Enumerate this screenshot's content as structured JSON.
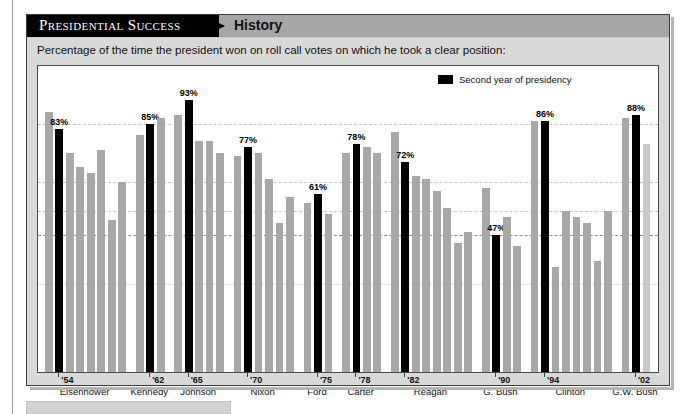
{
  "header": {
    "banner_title": "Presidential Success",
    "banner_sub": "History"
  },
  "subtitle": "Percentage of the time the president won on roll call votes on which he took a clear position:",
  "legend": {
    "swatch_color": "#000000",
    "label": "Second year of presidency"
  },
  "colors": {
    "bar_gray": "#a8a8a8",
    "bar_black": "#000000",
    "bar_light": "#c9c9c9",
    "card_bg": "#d9d9d9",
    "banner_bg": "#a6a6a6",
    "plot_bg": "#ffffff"
  },
  "chart_data": {
    "type": "bar",
    "title": "Presidential Success",
    "subtitle": "Percentage of the time the president won on roll call votes on which he took a clear position:",
    "xlabel": "",
    "ylabel": "",
    "ylim": [
      0,
      100
    ],
    "grid": true,
    "legend_position": "top-right",
    "legend": [
      "Second year of presidency"
    ],
    "highlight_label_suffix": "%",
    "series": [
      {
        "name": "Presidential success rate",
        "points": [
          {
            "president": "Eisenhower",
            "year": "'53",
            "value": 89,
            "second_year": false,
            "label": ""
          },
          {
            "president": "Eisenhower",
            "year": "'54",
            "value": 83,
            "second_year": true,
            "label": "83%"
          },
          {
            "president": "Eisenhower",
            "year": "'55",
            "value": 75,
            "second_year": false,
            "label": ""
          },
          {
            "president": "Eisenhower",
            "year": "'56",
            "value": 70,
            "second_year": false,
            "label": ""
          },
          {
            "president": "Eisenhower",
            "year": "'57",
            "value": 68,
            "second_year": false,
            "label": ""
          },
          {
            "president": "Eisenhower",
            "year": "'58",
            "value": 76,
            "second_year": false,
            "label": ""
          },
          {
            "president": "Eisenhower",
            "year": "'59",
            "value": 52,
            "second_year": false,
            "label": ""
          },
          {
            "president": "Eisenhower",
            "year": "'60",
            "value": 65,
            "second_year": false,
            "label": ""
          },
          {
            "president": "Kennedy",
            "year": "'61",
            "value": 81,
            "second_year": false,
            "label": ""
          },
          {
            "president": "Kennedy",
            "year": "'62",
            "value": 85,
            "second_year": true,
            "label": "85%"
          },
          {
            "president": "Kennedy",
            "year": "'63",
            "value": 87,
            "second_year": false,
            "label": ""
          },
          {
            "president": "Johnson",
            "year": "'64",
            "value": 88,
            "second_year": false,
            "label": ""
          },
          {
            "president": "Johnson",
            "year": "'65",
            "value": 93,
            "second_year": true,
            "label": "93%"
          },
          {
            "president": "Johnson",
            "year": "'66",
            "value": 79,
            "second_year": false,
            "label": ""
          },
          {
            "president": "Johnson",
            "year": "'67",
            "value": 79,
            "second_year": false,
            "label": ""
          },
          {
            "president": "Johnson",
            "year": "'68",
            "value": 75,
            "second_year": false,
            "label": ""
          },
          {
            "president": "Nixon",
            "year": "'69",
            "value": 74,
            "second_year": false,
            "label": ""
          },
          {
            "president": "Nixon",
            "year": "'70",
            "value": 77,
            "second_year": true,
            "label": "77%"
          },
          {
            "president": "Nixon",
            "year": "'71",
            "value": 75,
            "second_year": false,
            "label": ""
          },
          {
            "president": "Nixon",
            "year": "'72",
            "value": 66,
            "second_year": false,
            "label": ""
          },
          {
            "president": "Nixon",
            "year": "'73",
            "value": 51,
            "second_year": false,
            "label": ""
          },
          {
            "president": "Nixon",
            "year": "'74",
            "value": 60,
            "second_year": false,
            "label": ""
          },
          {
            "president": "Ford",
            "year": "'74",
            "value": 58,
            "second_year": false,
            "label": ""
          },
          {
            "president": "Ford",
            "year": "'75",
            "value": 61,
            "second_year": true,
            "label": "61%"
          },
          {
            "president": "Ford",
            "year": "'76",
            "value": 54,
            "second_year": false,
            "label": ""
          },
          {
            "president": "Carter",
            "year": "'77",
            "value": 75,
            "second_year": false,
            "label": ""
          },
          {
            "president": "Carter",
            "year": "'78",
            "value": 78,
            "second_year": true,
            "label": "78%"
          },
          {
            "president": "Carter",
            "year": "'79",
            "value": 77,
            "second_year": false,
            "label": ""
          },
          {
            "president": "Carter",
            "year": "'80",
            "value": 75,
            "second_year": false,
            "label": ""
          },
          {
            "president": "Reagan",
            "year": "'81",
            "value": 82,
            "second_year": false,
            "label": ""
          },
          {
            "president": "Reagan",
            "year": "'82",
            "value": 72,
            "second_year": true,
            "label": "72%"
          },
          {
            "president": "Reagan",
            "year": "'83",
            "value": 67,
            "second_year": false,
            "label": ""
          },
          {
            "president": "Reagan",
            "year": "'84",
            "value": 66,
            "second_year": false,
            "label": ""
          },
          {
            "president": "Reagan",
            "year": "'85",
            "value": 62,
            "second_year": false,
            "label": ""
          },
          {
            "president": "Reagan",
            "year": "'86",
            "value": 56,
            "second_year": false,
            "label": ""
          },
          {
            "president": "Reagan",
            "year": "'87",
            "value": 44,
            "second_year": false,
            "label": ""
          },
          {
            "president": "Reagan",
            "year": "'88",
            "value": 48,
            "second_year": false,
            "label": ""
          },
          {
            "president": "G. Bush",
            "year": "'89",
            "value": 63,
            "second_year": false,
            "label": ""
          },
          {
            "president": "G. Bush",
            "year": "'90",
            "value": 47,
            "second_year": true,
            "label": "47%"
          },
          {
            "president": "G. Bush",
            "year": "'91",
            "value": 53,
            "second_year": false,
            "label": ""
          },
          {
            "president": "G. Bush",
            "year": "'92",
            "value": 43,
            "second_year": false,
            "label": ""
          },
          {
            "president": "Clinton",
            "year": "'93",
            "value": 86,
            "second_year": false,
            "label": ""
          },
          {
            "president": "Clinton",
            "year": "'94",
            "value": 86,
            "second_year": true,
            "label": "86%"
          },
          {
            "president": "Clinton",
            "year": "'95",
            "value": 36,
            "second_year": false,
            "label": ""
          },
          {
            "president": "Clinton",
            "year": "'96",
            "value": 55,
            "second_year": false,
            "label": ""
          },
          {
            "president": "Clinton",
            "year": "'97",
            "value": 53,
            "second_year": false,
            "label": ""
          },
          {
            "president": "Clinton",
            "year": "'98",
            "value": 51,
            "second_year": false,
            "label": ""
          },
          {
            "president": "Clinton",
            "year": "'99",
            "value": 38,
            "second_year": false,
            "label": ""
          },
          {
            "president": "Clinton",
            "year": "'00",
            "value": 55,
            "second_year": false,
            "label": ""
          },
          {
            "president": "G.W. Bush",
            "year": "'01",
            "value": 87,
            "second_year": false,
            "label": ""
          },
          {
            "president": "G.W. Bush",
            "year": "'02",
            "value": 88,
            "second_year": true,
            "label": "88%"
          },
          {
            "president": "G.W. Bush",
            "year": "'03",
            "value": 78,
            "second_year": false,
            "label": "",
            "light": true
          }
        ]
      }
    ],
    "gridlines": [
      85,
      65,
      55,
      47,
      30
    ],
    "axis": {
      "groups": [
        {
          "president": "Eisenhower",
          "tick_year": "'54"
        },
        {
          "president": "Kennedy",
          "tick_year": "'62"
        },
        {
          "president": "Johnson",
          "tick_year": "'65"
        },
        {
          "president": "Nixon",
          "tick_year": "'70"
        },
        {
          "president": "Ford",
          "tick_year": "'75"
        },
        {
          "president": "Carter",
          "tick_year": "'78"
        },
        {
          "president": "Reagan",
          "tick_year": "'82"
        },
        {
          "president": "G. Bush",
          "tick_year": "'90"
        },
        {
          "president": "Clinton",
          "tick_year": "'94"
        },
        {
          "president": "G.W. Bush",
          "tick_year": "'02"
        }
      ]
    }
  }
}
